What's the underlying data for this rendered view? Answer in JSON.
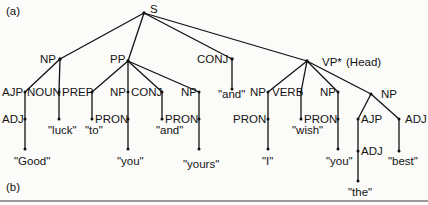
{
  "figure_labels": {
    "a": "(a)",
    "b": "(b)"
  },
  "tree": {
    "root": "S",
    "nodes": {
      "S": "S",
      "NP1": "NP",
      "PP": "PP",
      "CONJ1": "CONJ",
      "VP": "VP*",
      "VP_note": "(Head)",
      "AJP1": "AJP",
      "NOUN": "NOUN",
      "PREP": "PREP",
      "NP2": "NP",
      "CONJ2": "CONJ",
      "NP3": "NP",
      "and1": "\"and\"",
      "NP4": "NP",
      "VERB": "VERB",
      "NP5": "NP",
      "NP6": "NP",
      "ADJ1": "ADJ",
      "luck": "\"luck\"",
      "to": "\"to\"",
      "PRON1": "PRON",
      "and2": "\"and\"",
      "PRON2": "PRON",
      "PRON3": "PRON",
      "wish": "\"wish\"",
      "PRON4": "PRON",
      "AJP2": "AJP",
      "ADJ2": "ADJ",
      "Good": "\"Good\"",
      "you1": "\"you\"",
      "yours": "\"yours\"",
      "I": "\"I\"",
      "you2": "\"you\"",
      "ADJ3": "ADJ",
      "best": "\"best\"",
      "the": "\"the\""
    }
  }
}
